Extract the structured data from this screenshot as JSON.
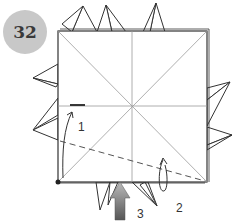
{
  "step": {
    "number": "32",
    "badge_color": "#c8c8c8"
  },
  "labels": [
    {
      "text": "1",
      "x": 78,
      "y": 120
    },
    {
      "text": "2",
      "x": 176,
      "y": 201
    },
    {
      "text": "3",
      "x": 137,
      "y": 209
    }
  ],
  "colors": {
    "line": "#333333",
    "crease": "#9a9a9a",
    "arrow_dark": "#555555",
    "arrow_light": "#bbbbbb"
  }
}
